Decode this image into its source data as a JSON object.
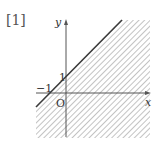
{
  "problem_number": "[1]",
  "axes": {
    "x_label": "x",
    "y_label": "y",
    "origin_label": "O"
  },
  "tick_labels": {
    "x_intercept": "−1",
    "y_intercept": "1"
  },
  "boundary_line": {
    "equation": "y = x + 1",
    "style": "solid"
  },
  "shaded_region": {
    "description": "y ≤ x + 1 (region below the line, hatched)",
    "hatch_color": "#9a9a9a"
  },
  "colors": {
    "line": "#3a3a3a",
    "axis": "#555555",
    "hatch": "#9a9a9a",
    "text": "#333333"
  }
}
